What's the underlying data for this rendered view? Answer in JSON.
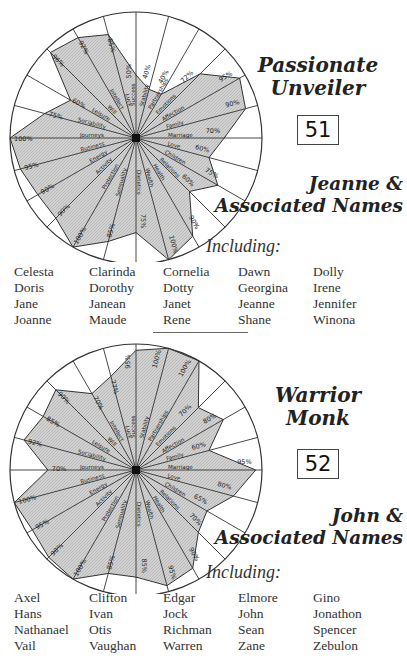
{
  "spokes": [
    "Success",
    "Stability",
    "Partnerships",
    "Emotions",
    "Affection",
    "Family",
    "Marriage",
    "Love",
    "Children",
    "Relations",
    "Health",
    "Wealth",
    "Dietetics",
    "Sensuality",
    "Protection",
    "Activity",
    "Energy",
    "Business",
    "Journeys",
    "Sociability",
    "Leisure",
    "Will",
    "Intellect",
    "Luck"
  ],
  "sections": [
    {
      "persona_line1": "Passionate",
      "persona_line2": "Unveiler",
      "number": "51",
      "group_line1": "Jeanne &",
      "group_line2": "Associated Names",
      "including_label": "Including:",
      "names": [
        [
          "Celesta",
          "Doris",
          "Jane",
          "Joanne"
        ],
        [
          "Clarinda",
          "Dorothy",
          "Janean",
          "Maude"
        ],
        [
          "Cornelia",
          "Dotty",
          "Janet",
          "Rene"
        ],
        [
          "Dawn",
          "Georgina",
          "Jeanne",
          "Shane"
        ],
        [
          "Dolly",
          "Irene",
          "Jennifer",
          "Winona"
        ]
      ]
    },
    {
      "persona_line1": "Warrior",
      "persona_line2": "Monk",
      "number": "52",
      "group_line1": "John &",
      "group_line2": "Associated Names",
      "including_label": "Including:",
      "names": [
        [
          "Axel",
          "Hans",
          "Nathanael",
          "Vail"
        ],
        [
          "Clifton",
          "Ivan",
          "Otis",
          "Vaughan"
        ],
        [
          "Edgar",
          "Jock",
          "Richman",
          "Warren"
        ],
        [
          "Elmore",
          "John",
          "Sean",
          "Zane"
        ],
        [
          "Gino",
          "Jonathon",
          "Spencer",
          "Zebulon"
        ]
      ]
    }
  ],
  "chart_data": [
    {
      "type": "radar",
      "title": "Passionate Unveiler",
      "categories": [
        "Success",
        "Stability",
        "Partnerships",
        "Emotions",
        "Affection",
        "Family",
        "Marriage",
        "Love",
        "Children",
        "Relations",
        "Health",
        "Wealth",
        "Dietetics",
        "Sensuality",
        "Protection",
        "Activity",
        "Energy",
        "Business",
        "Journeys",
        "Sociability",
        "Leisure",
        "Will",
        "Intellect",
        "Luck"
      ],
      "values": [
        50,
        40,
        40,
        72,
        95,
        90,
        70,
        60,
        75,
        60,
        90,
        100,
        75,
        85,
        100,
        90,
        90,
        95,
        100,
        75,
        60,
        96,
        92,
        85
      ],
      "value_labels": [
        "50%",
        "40%",
        "40%",
        "72%",
        "95%",
        "90%",
        "70%",
        "60%",
        "75%",
        "60%",
        "90%",
        "100%",
        "75%",
        "85%",
        "100%",
        "90%",
        "90%",
        "95%",
        "100%",
        "75%",
        "60%",
        "96%",
        "92%",
        "85%"
      ],
      "range": [
        0,
        100
      ],
      "fill_color": "#c8c8c8"
    },
    {
      "type": "radar",
      "title": "Warrior Monk",
      "categories": [
        "Success",
        "Stability",
        "Partnerships",
        "Emotions",
        "Affection",
        "Family",
        "Marriage",
        "Love",
        "Children",
        "Relations",
        "Health",
        "Wealth",
        "Dietetics",
        "Sensuality",
        "Protection",
        "Activity",
        "Energy",
        "Business",
        "Journeys",
        "Sociability",
        "Leisure",
        "Will",
        "Intellect",
        "Luck"
      ],
      "values": [
        95,
        100,
        100,
        70,
        80,
        60,
        95,
        80,
        65,
        70,
        90,
        95,
        85,
        85,
        100,
        98,
        95,
        100,
        70,
        92,
        85,
        90,
        70,
        77
      ],
      "value_labels": [
        "95%",
        "100%",
        "100%",
        "70%",
        "80%",
        "60%",
        "95%",
        "80%",
        "65%",
        "70%",
        "90%",
        "95%",
        "85%",
        "85%",
        "100%",
        "98%",
        "95%",
        "100%",
        "70%",
        "92%",
        "85%",
        "90%",
        "70%",
        "77%"
      ],
      "range": [
        0,
        100
      ],
      "fill_color": "#c8c8c8"
    }
  ]
}
